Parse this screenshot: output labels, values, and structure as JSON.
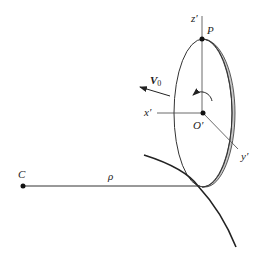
{
  "labels": {
    "center": "C",
    "radius": "ρ",
    "point_top": "P",
    "origin": "O′",
    "axis_x": "x′",
    "axis_y": "y′",
    "axis_z": "z′",
    "velocity_main": "V",
    "velocity_sub": "0"
  },
  "colors": {
    "stroke": "#222222",
    "disk_rim_fill": "#c8c8c8",
    "background": "#ffffff"
  }
}
